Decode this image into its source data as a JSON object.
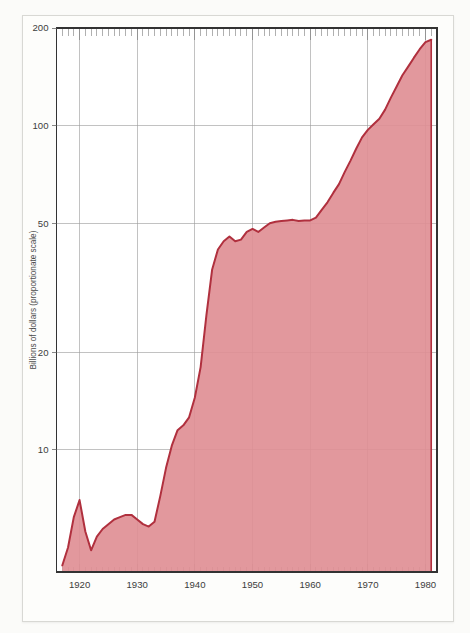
{
  "figure": {
    "background_color": "#fbfbf9",
    "card_color": "#fdfdfb",
    "card_border_color": "#d8d8d4"
  },
  "axis": {
    "ylabel": "Billions of dollars (proportionate scale)",
    "xlabel": "",
    "ytick_labels": [
      "200",
      "100",
      "50",
      "20",
      "10"
    ],
    "xtick_labels": [
      "1920",
      "1930",
      "1940",
      "1950",
      "1960",
      "1970",
      "1980"
    ]
  },
  "chart_data": {
    "type": "area",
    "title": "",
    "subtitle": "",
    "xlabel": "",
    "ylabel": "Billions of dollars (proportionate scale)",
    "yscale": "log",
    "ylim": [
      4.2,
      200
    ],
    "xlim": [
      1916.0,
      1982.0
    ],
    "grid": true,
    "legend": null,
    "ytick_values": [
      200,
      100,
      50,
      20,
      10
    ],
    "xtick_values": [
      1920,
      1930,
      1940,
      1950,
      1960,
      1970,
      1980
    ],
    "line_color": "#b0303e",
    "fill_color": "#e08f95",
    "x": [
      1917,
      1918,
      1919,
      1920,
      1921,
      1922,
      1923,
      1924,
      1925,
      1926,
      1927,
      1928,
      1929,
      1930,
      1931,
      1932,
      1933,
      1934,
      1935,
      1936,
      1937,
      1938,
      1939,
      1940,
      1941,
      1942,
      1943,
      1944,
      1945,
      1946,
      1947,
      1948,
      1949,
      1950,
      1951,
      1952,
      1953,
      1954,
      1955,
      1956,
      1957,
      1958,
      1959,
      1960,
      1961,
      1962,
      1963,
      1964,
      1965,
      1966,
      1967,
      1968,
      1969,
      1970,
      1971,
      1972,
      1973,
      1974,
      1975,
      1976,
      1977,
      1978,
      1979,
      1980,
      1981
    ],
    "values": [
      4.4,
      5.0,
      6.2,
      7.0,
      5.6,
      4.9,
      5.4,
      5.7,
      5.9,
      6.1,
      6.2,
      6.3,
      6.3,
      6.1,
      5.9,
      5.8,
      6.0,
      7.2,
      8.8,
      10.3,
      11.5,
      11.9,
      12.6,
      14.5,
      18.0,
      26.0,
      36.0,
      41.5,
      44.0,
      45.5,
      44.0,
      44.5,
      47.0,
      48.0,
      47.0,
      48.5,
      50.0,
      50.5,
      50.8,
      51.0,
      51.2,
      50.8,
      51.0,
      51.0,
      52.0,
      55.0,
      58.0,
      62.0,
      66.0,
      72.0,
      78.0,
      85.0,
      92.0,
      97.0,
      101.0,
      105.0,
      112.0,
      122.0,
      132.0,
      143.0,
      152.0,
      162.0,
      172.0,
      181.0,
      184.0
    ],
    "annotations": []
  }
}
